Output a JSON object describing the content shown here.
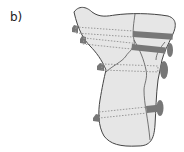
{
  "figure": {
    "panel_label": "b)",
    "colors": {
      "bone_fill": "#e6e6e6",
      "outline": "#444444",
      "screw_light": "#bdbdbd",
      "screw_dark": "#6e6e6e"
    },
    "screw_count": 4
  }
}
